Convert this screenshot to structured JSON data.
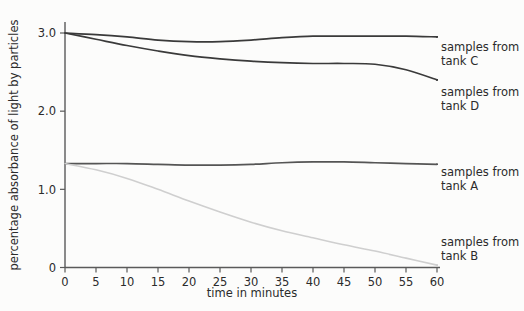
{
  "chart_data": {
    "type": "line",
    "title": "",
    "xlabel": "time in minutes",
    "ylabel": "percentage absorbance of light by particles",
    "xlim": [
      0,
      60
    ],
    "ylim": [
      0,
      3.15
    ],
    "grid": false,
    "legend_position": "right",
    "xticks": [
      "0",
      "5",
      "10",
      "15",
      "20",
      "25",
      "30",
      "35",
      "40",
      "45",
      "50",
      "55",
      "60"
    ],
    "yticks": [
      "0",
      "1.0",
      "2.0",
      "3.0"
    ],
    "x": [
      0,
      5,
      10,
      15,
      20,
      25,
      30,
      35,
      40,
      45,
      50,
      55,
      60
    ],
    "series": [
      {
        "name": "samples from tank C",
        "label_line1": "samples from",
        "label_line2": "tank C",
        "color": "#3a3a3a",
        "values": [
          3.0,
          2.98,
          2.95,
          2.91,
          2.89,
          2.89,
          2.91,
          2.94,
          2.96,
          2.96,
          2.96,
          2.96,
          2.95
        ]
      },
      {
        "name": "samples from tank D",
        "label_line1": "samples from",
        "label_line2": "tank D",
        "color": "#3a3a3a",
        "values": [
          3.0,
          2.92,
          2.84,
          2.77,
          2.71,
          2.67,
          2.64,
          2.62,
          2.61,
          2.61,
          2.6,
          2.53,
          2.4
        ]
      },
      {
        "name": "samples from tank A",
        "label_line1": "samples from",
        "label_line2": "tank A",
        "color": "#555555",
        "values": [
          1.33,
          1.33,
          1.33,
          1.32,
          1.31,
          1.31,
          1.32,
          1.34,
          1.35,
          1.35,
          1.34,
          1.33,
          1.32
        ]
      },
      {
        "name": "samples from tank B",
        "label_line1": "samples from",
        "label_line2": "tank B",
        "color": "#cfcfcf",
        "values": [
          1.33,
          1.25,
          1.14,
          1.0,
          0.85,
          0.71,
          0.58,
          0.47,
          0.38,
          0.29,
          0.21,
          0.12,
          0.03
        ]
      }
    ]
  },
  "axes": {
    "y_title": "percentage absorbance of light by particles",
    "x_title": "time in minutes",
    "yticks": [
      {
        "label": "3.0",
        "value": 3.0
      },
      {
        "label": "2.0",
        "value": 2.0
      },
      {
        "label": "1.0",
        "value": 1.0
      },
      {
        "label": "0",
        "value": 0
      }
    ],
    "xticks": [
      {
        "label": "0",
        "value": 0
      },
      {
        "label": "5",
        "value": 5
      },
      {
        "label": "10",
        "value": 10
      },
      {
        "label": "15",
        "value": 15
      },
      {
        "label": "20",
        "value": 20
      },
      {
        "label": "25",
        "value": 25
      },
      {
        "label": "30",
        "value": 30
      },
      {
        "label": "35",
        "value": 35
      },
      {
        "label": "40",
        "value": 40
      },
      {
        "label": "45",
        "value": 45
      },
      {
        "label": "50",
        "value": 50
      },
      {
        "label": "55",
        "value": 55
      },
      {
        "label": "60",
        "value": 60
      }
    ]
  },
  "legend": [
    {
      "line1": "samples from",
      "line2": "tank C"
    },
    {
      "line1": "samples from",
      "line2": "tank D"
    },
    {
      "line1": "samples from",
      "line2": "tank A"
    },
    {
      "line1": "samples from",
      "line2": "tank B"
    }
  ],
  "colors": {
    "background": "#fcfcfb",
    "axis": "#4a4a4a",
    "text": "#2b2b2b",
    "series_dark": "#3a3a3a",
    "series_mid": "#555555",
    "series_light": "#cfcfcf"
  }
}
